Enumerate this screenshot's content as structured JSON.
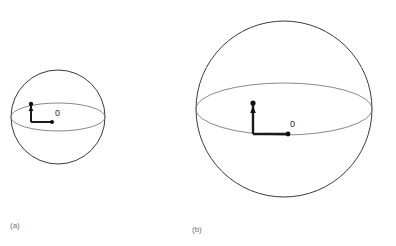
{
  "figure": {
    "background_color": "#ffffff",
    "outline_color": "#3a3a3a",
    "equator_color": "#7a7a7a",
    "vector_color": "#1a1a1a",
    "label_color": "#2b2b2b",
    "panel_label_color": "#6f6f6f",
    "panels": [
      {
        "id": "panel-a",
        "caption": "(a)",
        "caption_x": 10,
        "caption_y": 228,
        "sphere": {
          "cx": 58,
          "cy": 117,
          "r": 47
        },
        "equator": {
          "back_arc": "M 11 117 A 47 14 0 0 1 105 117",
          "front_arc": "M 11 117 A 47 14 0 0 0 105 117"
        },
        "origin": {
          "x": 52,
          "y": 122,
          "label": "0",
          "label_x": 55,
          "label_y": 116,
          "dot_r": 2.0
        },
        "horizontal_vector": {
          "x1": 52,
          "y1": 122,
          "x2": 31,
          "y2": 122,
          "width": 2.0
        },
        "vertical_vector": {
          "x1": 31,
          "y1": 122,
          "x2": 31,
          "y2": 105,
          "width": 2.0,
          "tip_dot_x": 31,
          "tip_dot_y": 104,
          "tip_dot_r": 2.2,
          "arrowhead": "31,106 28.6,111 33.4,111"
        }
      },
      {
        "id": "panel-b",
        "caption": "(b)",
        "caption_x": 192,
        "caption_y": 232,
        "sphere": {
          "cx": 284,
          "cy": 109,
          "r": 88
        },
        "equator": {
          "back_arc": "M 196 109 A 88 26 0 0 1 372 109",
          "front_arc": "M 196 109 A 88 26 0 0 0 372 109"
        },
        "origin": {
          "x": 288,
          "y": 134,
          "label": "0",
          "label_x": 290,
          "label_y": 127,
          "dot_r": 2.4
        },
        "horizontal_vector": {
          "x1": 288,
          "y1": 134,
          "x2": 253,
          "y2": 134,
          "width": 2.4
        },
        "vertical_vector": {
          "x1": 253,
          "y1": 134,
          "x2": 253,
          "y2": 105,
          "width": 2.4,
          "tip_dot_x": 253,
          "tip_dot_y": 103,
          "tip_dot_r": 2.6,
          "arrowhead": "253,106 250.2,113 255.8,113"
        }
      }
    ]
  }
}
